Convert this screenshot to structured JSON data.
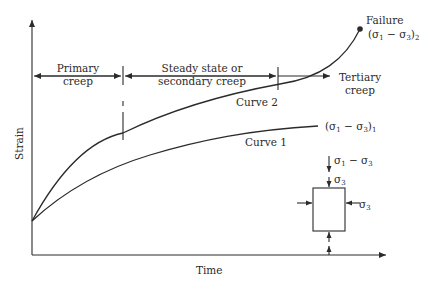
{
  "figure": {
    "x_axis_label": "Time",
    "y_axis_label": "Strain",
    "phases": [
      {
        "label_line1": "Primary",
        "label_line2": "creep"
      },
      {
        "label_line1": "Steady state or",
        "label_line2": "secondary creep"
      },
      {
        "label_line1": "Tertiary",
        "label_line2": "creep"
      }
    ],
    "curves": [
      {
        "name": "Curve 1",
        "stress_label": "(σ1 − σ3)1"
      },
      {
        "name": "Curve 2",
        "stress_label": "(σ1 − σ3)2",
        "end_label": "Failure"
      }
    ],
    "specimen": {
      "top_load_label": "σ1 − σ3",
      "confining_top_label": "σ3",
      "confining_side_label": "σ3"
    },
    "colors": {
      "line": "#2b2b2b",
      "background": "#ffffff"
    }
  }
}
